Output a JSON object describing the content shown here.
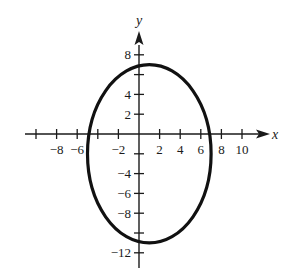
{
  "chart_data": {
    "type": "line",
    "title": "",
    "xlabel": "x",
    "ylabel": "y",
    "xlim": [
      -11,
      12
    ],
    "ylim": [
      -13,
      10
    ],
    "grid": false,
    "x_ticks": [
      -10,
      -8,
      -6,
      -4,
      -2,
      0,
      2,
      4,
      6,
      8,
      10
    ],
    "x_tick_labels": [
      "-8",
      "-6",
      "-2",
      "2",
      "4",
      "6",
      "8",
      "10"
    ],
    "x_tick_label_values": [
      -8,
      -6,
      -2,
      2,
      4,
      6,
      8,
      10
    ],
    "y_ticks": [
      -12,
      -10,
      -8,
      -6,
      -4,
      -2,
      2,
      4,
      6,
      8
    ],
    "y_tick_labels": [
      "8",
      "4",
      "2",
      "-4",
      "-6",
      "-8",
      "-12"
    ],
    "y_tick_label_values": [
      8,
      4,
      2,
      -4,
      -6,
      -8,
      -12
    ],
    "series": [
      {
        "name": "ellipse",
        "shape": "ellipse",
        "center": [
          1,
          -2
        ],
        "semi_axis_x": 6,
        "semi_axis_y": 9,
        "equation": "(x-1)^2/36 + (y+2)^2/81 = 1",
        "extremes": {
          "left": [
            -5,
            -2
          ],
          "right": [
            7,
            -2
          ],
          "top": [
            1,
            7
          ],
          "bottom": [
            1,
            -11
          ]
        }
      }
    ]
  },
  "labels": {
    "x_axis": "x",
    "y_axis": "y",
    "x_ticks": [
      {
        "v": -8,
        "t": "−8"
      },
      {
        "v": -6,
        "t": "−6"
      },
      {
        "v": -2,
        "t": "−2"
      },
      {
        "v": 2,
        "t": "2"
      },
      {
        "v": 4,
        "t": "4"
      },
      {
        "v": 6,
        "t": "6"
      },
      {
        "v": 8,
        "t": "8"
      },
      {
        "v": 10,
        "t": "10"
      }
    ],
    "y_ticks": [
      {
        "v": 8,
        "t": "8"
      },
      {
        "v": 4,
        "t": "4"
      },
      {
        "v": 2,
        "t": "2"
      },
      {
        "v": -4,
        "t": "−4"
      },
      {
        "v": -6,
        "t": "−6"
      },
      {
        "v": -8,
        "t": "−8"
      },
      {
        "v": -12,
        "t": "−12"
      }
    ]
  }
}
